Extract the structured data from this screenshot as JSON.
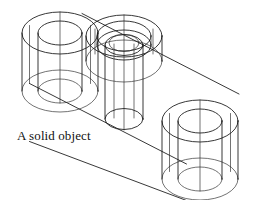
{
  "figure": {
    "caption": "A solid object",
    "kind": "isometric-wireframe-cad-drawing",
    "background_color": "#ffffff",
    "line_color": "#141414",
    "canvas": {
      "width": 259,
      "height": 200
    }
  },
  "geometry": {
    "projection": "isometric",
    "axis_dx": 0.866,
    "axis_dy": 0.5,
    "slab": {
      "thickness_px": 58,
      "top_front_edge": {
        "x1": 29,
        "y1": 83,
        "x2": 186,
        "y2": 163
      },
      "top_back_edge": {
        "x1": 82,
        "y1": 13,
        "x2": 239,
        "y2": 93
      },
      "bottom_front_edge": {
        "x1": 29,
        "y1": 141,
        "x2": 186,
        "y2": 200
      }
    },
    "features": [
      {
        "name": "left-end-boss",
        "type": "cylinder-with-through-hole",
        "center": {
          "x": 60,
          "y": 33
        },
        "outer_rx": 38,
        "outer_ry": 21,
        "inner_rx": 22,
        "inner_ry": 12,
        "height_px": 58
      },
      {
        "name": "middle-counterbored-boss",
        "type": "raised-boss-with-counterbore",
        "center": {
          "x": 124,
          "y": 36
        },
        "outer_rx": 38,
        "outer_ry": 21,
        "counterbore_rx": 27,
        "counterbore_ry": 15,
        "bore_rx": 19,
        "bore_ry": 10.5,
        "inner_rx": 15,
        "inner_ry": 8.5,
        "boss_height_px": 25,
        "through_hole_depth_px": 74
      },
      {
        "name": "right-end-boss",
        "type": "cylinder-with-through-hole",
        "center": {
          "x": 200,
          "y": 121
        },
        "outer_rx": 38,
        "outer_ry": 21,
        "inner_rx": 22,
        "inner_ry": 12,
        "height_px": 58
      }
    ]
  },
  "labels": {
    "caption_text": "A solid object"
  }
}
